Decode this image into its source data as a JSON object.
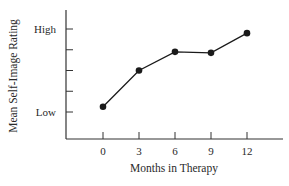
{
  "chart_data": {
    "type": "line",
    "title": "",
    "xlabel": "Months in Therapy",
    "ylabel": "Mean Self-Image Rating",
    "x": [
      0,
      3,
      6,
      9,
      12
    ],
    "categories": [
      "0",
      "3",
      "6",
      "9",
      "12"
    ],
    "series": [
      {
        "name": "Mean Self-Image Rating",
        "values": [
          0.25,
          2.0,
          2.9,
          2.85,
          3.8
        ]
      }
    ],
    "values": [
      0.25,
      2.0,
      2.9,
      2.85,
      3.8
    ],
    "y_scale_note": "relative scale: Low = 0, High = 4; unlabeled intermediate ticks at 1, 2, 3",
    "y_tick_labels": [
      {
        "value": 0,
        "label": "Low"
      },
      {
        "value": 1,
        "label": ""
      },
      {
        "value": 2,
        "label": ""
      },
      {
        "value": 3,
        "label": ""
      },
      {
        "value": 4,
        "label": "High"
      }
    ],
    "ylim": [
      -1.3,
      4.9
    ],
    "xlim": [
      -5,
      17
    ],
    "grid": false,
    "legend": "none",
    "markers": "filled-circle",
    "colors": {
      "line": "#1a1a1a",
      "marker": "#1a1a1a",
      "axis": "#333333",
      "text": "#2a2a2a"
    }
  }
}
